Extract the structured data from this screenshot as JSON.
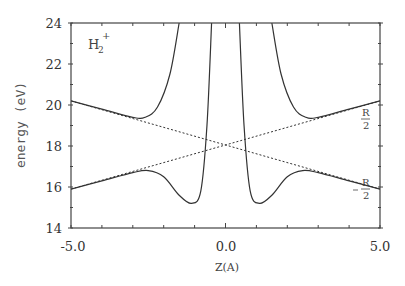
{
  "chart_data": {
    "type": "line",
    "title": "",
    "annotation_molecule": "H2+",
    "annotation_sub": "2",
    "annotation_sup": "+",
    "annotation_main": "H",
    "xlabel": "Z(A)",
    "ylabel": "energy (eV)",
    "xlim": [
      -5.0,
      5.0
    ],
    "ylim": [
      14,
      24
    ],
    "x_ticks": [
      "-5.0",
      "0.0",
      "5.0"
    ],
    "y_ticks": [
      "14",
      "16",
      "18",
      "20",
      "22",
      "24"
    ],
    "grid": false,
    "legend": null,
    "line_labels": {
      "upper_right": "R/2",
      "lower_right": "-R/2"
    },
    "series": [
      {
        "name": "upper adiabatic curve (left branch)",
        "style": "solid",
        "x": [
          -5.0,
          -4.0,
          -3.0,
          -2.6,
          -2.2,
          -1.8,
          -1.5
        ],
        "y": [
          20.2,
          19.8,
          19.4,
          19.4,
          19.9,
          21.5,
          24.0
        ]
      },
      {
        "name": "upper adiabatic curve (right branch)",
        "style": "solid",
        "x": [
          1.5,
          1.8,
          2.2,
          2.6,
          3.0,
          4.0,
          5.0
        ],
        "y": [
          24.0,
          21.5,
          19.9,
          19.4,
          19.4,
          19.8,
          20.2
        ]
      },
      {
        "name": "lower adiabatic curve (left)",
        "style": "solid",
        "x": [
          -5.0,
          -4.0,
          -3.0,
          -2.5,
          -2.0,
          -1.5,
          -1.1,
          -0.8,
          -0.6,
          -0.45
        ],
        "y": [
          15.9,
          16.3,
          16.7,
          16.8,
          16.5,
          15.6,
          15.2,
          15.8,
          19.0,
          24.0
        ]
      },
      {
        "name": "lower adiabatic curve (right)",
        "style": "solid",
        "x": [
          0.45,
          0.6,
          0.8,
          1.1,
          1.5,
          2.0,
          2.5,
          3.0,
          4.0,
          5.0
        ],
        "y": [
          24.0,
          19.0,
          15.8,
          15.2,
          15.6,
          16.5,
          16.8,
          16.7,
          16.3,
          15.9
        ]
      },
      {
        "name": "diabatic R/2",
        "style": "dotted",
        "x": [
          -5.0,
          5.0
        ],
        "y": [
          15.9,
          20.2
        ]
      },
      {
        "name": "diabatic -R/2",
        "style": "dotted",
        "x": [
          -5.0,
          5.0
        ],
        "y": [
          20.2,
          15.9
        ]
      }
    ]
  }
}
